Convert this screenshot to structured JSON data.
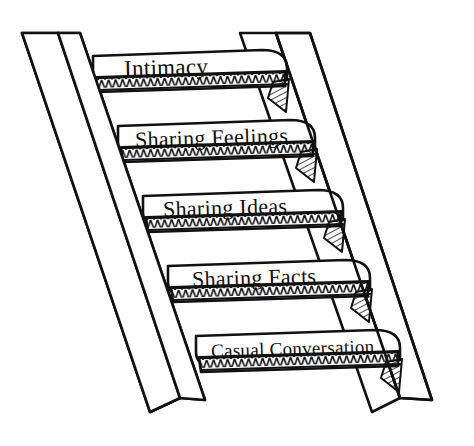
{
  "diagram": {
    "type": "staircase-diagram",
    "orientation": "ascending-right-to-left",
    "background_color": "#ffffff",
    "ink_color": "#111111",
    "style": "hand-drawn line art",
    "steps": [
      {
        "index": 1,
        "label": "Intimacy",
        "position": "top",
        "level": 5,
        "font_size_px": 23
      },
      {
        "index": 2,
        "label": "Sharing Feelings",
        "position": "second",
        "level": 4,
        "font_size_px": 22
      },
      {
        "index": 3,
        "label": "Sharing Ideas",
        "position": "middle",
        "level": 3,
        "font_size_px": 22
      },
      {
        "index": 4,
        "label": "Sharing Facts",
        "position": "fourth",
        "level": 2,
        "font_size_px": 22
      },
      {
        "index": 5,
        "label": "Casual Conversation",
        "position": "bottom",
        "level": 1,
        "font_size_px": 19
      }
    ],
    "rails": [
      {
        "side": "left",
        "name": "left-stringer",
        "boards": 2
      },
      {
        "side": "right",
        "name": "right-stringer",
        "boards": 2
      }
    ]
  }
}
